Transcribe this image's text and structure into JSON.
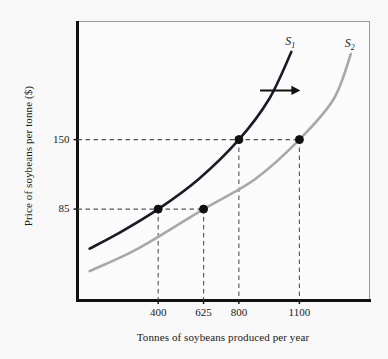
{
  "chart_data": {
    "type": "line",
    "title": "",
    "xlabel": "Tonnes of soybeans produced per year",
    "ylabel": "Price of soybeans per tonne ($)",
    "xlim": [
      0,
      1450
    ],
    "ylim": [
      0,
      260
    ],
    "grid": false,
    "legend_position": "inline-curve-end",
    "xticks": [
      {
        "value": 400,
        "label": "400"
      },
      {
        "value": 625,
        "label": "625"
      },
      {
        "value": 800,
        "label": "800"
      },
      {
        "value": 1100,
        "label": "1100"
      }
    ],
    "yticks": [
      {
        "value": 85,
        "label": "85"
      },
      {
        "value": 150,
        "label": "150"
      }
    ],
    "series": [
      {
        "name": "S1",
        "label": "S",
        "sub": "1",
        "color": "#1b1b28",
        "description": "Original upward-sloping supply curve",
        "points": [
          {
            "x": 60,
            "y": 48
          },
          {
            "x": 200,
            "y": 62
          },
          {
            "x": 400,
            "y": 85
          },
          {
            "x": 600,
            "y": 113
          },
          {
            "x": 800,
            "y": 150
          },
          {
            "x": 950,
            "y": 188
          },
          {
            "x": 1060,
            "y": 232
          }
        ]
      },
      {
        "name": "S2",
        "label": "S",
        "sub": "2",
        "color": "#a8a8a8",
        "description": "Supply curve after rightward shift",
        "points": [
          {
            "x": 60,
            "y": 27
          },
          {
            "x": 300,
            "y": 48
          },
          {
            "x": 625,
            "y": 85
          },
          {
            "x": 880,
            "y": 113
          },
          {
            "x": 1100,
            "y": 150
          },
          {
            "x": 1270,
            "y": 188
          },
          {
            "x": 1355,
            "y": 230
          }
        ]
      }
    ],
    "markers": [
      {
        "x": 400,
        "y": 85,
        "series": "S1",
        "label": ""
      },
      {
        "x": 625,
        "y": 85,
        "series": "S2",
        "label": ""
      },
      {
        "x": 800,
        "y": 150,
        "series": "S1",
        "label": ""
      },
      {
        "x": 1100,
        "y": 150,
        "series": "S2",
        "label": ""
      }
    ],
    "guide_lines": [
      {
        "orientation": "horizontal",
        "y": 85,
        "from_x": 0,
        "to_x": 625
      },
      {
        "orientation": "horizontal",
        "y": 150,
        "from_x": 0,
        "to_x": 1100
      },
      {
        "orientation": "vertical",
        "x": 400,
        "from_y": 0,
        "to_y": 85
      },
      {
        "orientation": "vertical",
        "x": 625,
        "from_y": 0,
        "to_y": 85
      },
      {
        "orientation": "vertical",
        "x": 800,
        "from_y": 0,
        "to_y": 150
      },
      {
        "orientation": "vertical",
        "x": 1100,
        "from_y": 0,
        "to_y": 150
      }
    ],
    "annotations": [
      {
        "type": "arrow",
        "name": "supply-shift-arrow",
        "direction": "right",
        "from": {
          "x": 905,
          "y": 196
        },
        "to": {
          "x": 1105,
          "y": 196
        },
        "color": "#111111"
      }
    ]
  }
}
